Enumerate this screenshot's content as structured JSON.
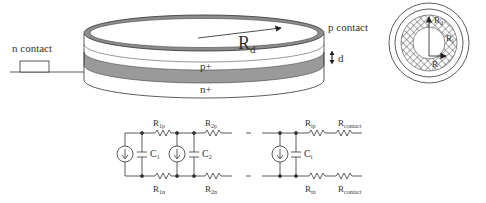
{
  "disk_diagram": {
    "n_contact_label": "n contact",
    "p_contact_label": "p contact",
    "radius_label": "R",
    "radius_sub": "d",
    "thickness_label": "d",
    "p_layer_label": "p+",
    "n_layer_label": "n+"
  },
  "top_view": {
    "outer_radius_label": "R",
    "outer_radius_sub": "d",
    "inner_ring_label": "R",
    "inner_ring_sub": "i",
    "center_radius_label": "R",
    "center_radius_sub": ""
  },
  "circuit": {
    "top_resistors": [
      {
        "label": "R",
        "sub": "1p"
      },
      {
        "label": "R",
        "sub": "2p"
      },
      {
        "label": "R",
        "sub": "ip"
      },
      {
        "label": "R",
        "sub": "contact"
      }
    ],
    "bottom_resistors": [
      {
        "label": "R",
        "sub": "1n"
      },
      {
        "label": "R",
        "sub": "2n"
      },
      {
        "label": "R",
        "sub": "in"
      },
      {
        "label": "R",
        "sub": "contact"
      }
    ],
    "capacitors": [
      {
        "label": "C",
        "sub": "1"
      },
      {
        "label": "C",
        "sub": "2"
      },
      {
        "label": "C",
        "sub": "i"
      }
    ],
    "current_sources": 3
  },
  "colors": {
    "line": "#333333",
    "layer_gray": "#9a9a9a",
    "ring_gray": "#8c8c8c",
    "hatch": "#555555"
  }
}
